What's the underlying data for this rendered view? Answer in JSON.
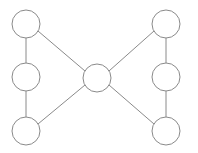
{
  "diagram": {
    "type": "node-link-diagram",
    "shape": "bowtie",
    "background_color": "#ffffff",
    "stroke_color": "#8a8a8a",
    "node_fill_color": "#ffffff",
    "stroke_width": 1,
    "canvas": {
      "width": 198,
      "height": 153
    },
    "node_count": 7,
    "edge_count": 8,
    "nodes": [
      {
        "id": "n1",
        "name": "top-left-node",
        "label": "",
        "cx": 26,
        "cy": 24,
        "r": 14
      },
      {
        "id": "n2",
        "name": "middle-left-node",
        "label": "",
        "cx": 26,
        "cy": 77,
        "r": 14
      },
      {
        "id": "n3",
        "name": "bottom-left-node",
        "label": "",
        "cx": 26,
        "cy": 131,
        "r": 14
      },
      {
        "id": "n4",
        "name": "center-hub-node",
        "label": "",
        "cx": 97,
        "cy": 78,
        "r": 14
      },
      {
        "id": "n5",
        "name": "top-right-node",
        "label": "",
        "cx": 166,
        "cy": 24,
        "r": 14
      },
      {
        "id": "n6",
        "name": "middle-right-node",
        "label": "",
        "cx": 166,
        "cy": 77,
        "r": 14
      },
      {
        "id": "n7",
        "name": "bottom-right-node",
        "label": "",
        "cx": 166,
        "cy": 131,
        "r": 14
      }
    ],
    "edges": [
      {
        "id": "e1",
        "name": "edge-top-left-to-middle-left",
        "source": "n1",
        "target": "n2",
        "x1": 26,
        "y1": 38,
        "x2": 26,
        "y2": 63
      },
      {
        "id": "e2",
        "name": "edge-middle-left-to-bottom-left",
        "source": "n2",
        "target": "n3",
        "x1": 26,
        "y1": 91,
        "x2": 26,
        "y2": 117
      },
      {
        "id": "e3",
        "name": "edge-top-left-to-center",
        "source": "n1",
        "target": "n4",
        "x1": 38,
        "y1": 31,
        "x2": 85,
        "y2": 71
      },
      {
        "id": "e4",
        "name": "edge-bottom-left-to-center",
        "source": "n3",
        "target": "n4",
        "x1": 38,
        "y1": 124,
        "x2": 85,
        "y2": 85
      },
      {
        "id": "e5",
        "name": "edge-center-to-top-right",
        "source": "n4",
        "target": "n5",
        "x1": 109,
        "y1": 71,
        "x2": 154,
        "y2": 31
      },
      {
        "id": "e6",
        "name": "edge-center-to-bottom-right",
        "source": "n4",
        "target": "n7",
        "x1": 109,
        "y1": 85,
        "x2": 154,
        "y2": 124
      },
      {
        "id": "e7",
        "name": "edge-top-right-to-middle-right",
        "source": "n5",
        "target": "n6",
        "x1": 166,
        "y1": 38,
        "x2": 166,
        "y2": 63
      },
      {
        "id": "e8",
        "name": "edge-middle-right-to-bottom-right",
        "source": "n6",
        "target": "n7",
        "x1": 166,
        "y1": 91,
        "x2": 166,
        "y2": 117
      }
    ]
  }
}
